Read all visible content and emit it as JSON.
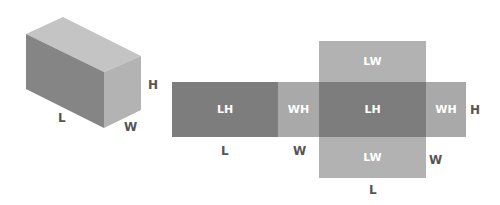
{
  "colors": {
    "dark": "#7a7a7a",
    "mid": "#a0a0a0",
    "light": "#b8b8b8",
    "top": "#c2c2c2",
    "label": "#555555",
    "face_text": "#ffffff"
  },
  "box": {
    "label_length": "L",
    "label_width": "W",
    "label_height": "H"
  },
  "net": {
    "faces": [
      {
        "id": "lh-left",
        "label": "LH"
      },
      {
        "id": "wh-left",
        "label": "WH"
      },
      {
        "id": "lh-center",
        "label": "LH"
      },
      {
        "id": "wh-right",
        "label": "WH"
      },
      {
        "id": "lw-top",
        "label": "LW"
      },
      {
        "id": "lw-bottom",
        "label": "LW"
      }
    ],
    "dim_labels": {
      "under_lh": "L",
      "under_wh": "W",
      "right_h": "H",
      "right_w": "W",
      "bottom_l": "L"
    }
  }
}
